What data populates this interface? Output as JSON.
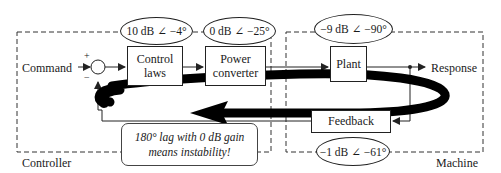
{
  "diagram": {
    "regions": {
      "controller": "Controller",
      "machine": "Machine"
    },
    "signals": {
      "input": "Command",
      "output": "Response",
      "summing_plus": "+",
      "summing_minus": "−"
    },
    "blocks": {
      "control_laws": "Control laws",
      "control_laws_line1": "Control",
      "control_laws_line2": "laws",
      "power_converter_line1": "Power",
      "power_converter_line2": "converter",
      "plant": "Plant",
      "feedback": "Feedback"
    },
    "gains": {
      "control_laws": "10 dB ∠ −4°",
      "power_converter": "0 dB ∠ −25°",
      "plant": "−9 dB ∠ −90°",
      "feedback": "−1 dB ∠ −61°"
    },
    "note": {
      "line1": "180° lag with 0 dB gain",
      "line2": "means instability!"
    },
    "colors": {
      "line": "#222222",
      "loop_arrow": "#000000",
      "background": "#ffffff"
    }
  }
}
